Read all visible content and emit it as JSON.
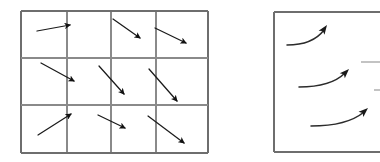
{
  "figure": {
    "background_color": "#ffffff",
    "stroke_color": "#1a1a1a",
    "grid_color": "#8a8a8a",
    "border_color": "#6e6e6e"
  },
  "left_panel": {
    "name": "discrete-vector-field-grid",
    "x": 21,
    "y": 11,
    "width": 187,
    "height": 142,
    "columns": 4,
    "rows": 3,
    "column_edges": [
      21,
      67,
      111,
      156,
      208
    ],
    "row_edges": [
      11,
      58,
      105,
      153
    ],
    "arrows": [
      {
        "id": "r1c1",
        "row": 1,
        "col": 1,
        "x1": 37,
        "y1": 31,
        "x2": 70,
        "y2": 25,
        "angle_deg": -10,
        "label": "arrow-r1c1"
      },
      {
        "id": "r1c3",
        "row": 1,
        "col": 3,
        "x1": 113,
        "y1": 19,
        "x2": 140,
        "y2": 38,
        "angle_deg": 35,
        "label": "arrow-r1c3"
      },
      {
        "id": "r1c4",
        "row": 1,
        "col": 4,
        "x1": 155,
        "y1": 28,
        "x2": 186,
        "y2": 43,
        "angle_deg": 26,
        "label": "arrow-r1c4"
      },
      {
        "id": "r2c1",
        "row": 2,
        "col": 1,
        "x1": 41,
        "y1": 63,
        "x2": 74,
        "y2": 81,
        "angle_deg": 29,
        "label": "arrow-r2c1"
      },
      {
        "id": "r2c2",
        "row": 2,
        "col": 2,
        "x1": 99,
        "y1": 66,
        "x2": 124,
        "y2": 94,
        "angle_deg": 48,
        "label": "arrow-r2c2"
      },
      {
        "id": "r2c3",
        "row": 2,
        "col": 3,
        "x1": 149,
        "y1": 69,
        "x2": 177,
        "y2": 101,
        "angle_deg": 49,
        "label": "arrow-r2c3"
      },
      {
        "id": "r3c1",
        "row": 3,
        "col": 1,
        "x1": 38,
        "y1": 135,
        "x2": 71,
        "y2": 114,
        "angle_deg": -32,
        "label": "arrow-r3c1"
      },
      {
        "id": "r3c2",
        "row": 3,
        "col": 2,
        "x1": 98,
        "y1": 115,
        "x2": 125,
        "y2": 128,
        "angle_deg": 26,
        "label": "arrow-r3c2"
      },
      {
        "id": "r3c3",
        "row": 3,
        "col": 3,
        "x1": 148,
        "y1": 116,
        "x2": 184,
        "y2": 143,
        "angle_deg": 37,
        "label": "arrow-r3c3"
      }
    ]
  },
  "right_panel": {
    "name": "continuous-streamline-panel",
    "x": 274,
    "y": 12,
    "width": 106,
    "height": 140,
    "clipped_right_edge": true,
    "streamlines": [
      {
        "id": "s1",
        "label": "streamline-top",
        "path": "M 287,45 C 302,45 315,42 324,30",
        "tip_x": 327,
        "tip_y": 25,
        "tip_angle_deg": -55
      },
      {
        "id": "s2",
        "label": "streamline-middle",
        "path": "M 299,87 C 318,87 334,84 345,73",
        "tip_x": 349,
        "tip_y": 69,
        "tip_angle_deg": -45
      },
      {
        "id": "s3",
        "label": "streamline-bottom",
        "path": "M 311,126 C 333,126 352,122 364,112",
        "tip_x": 368,
        "tip_y": 108,
        "tip_angle_deg": -42
      }
    ],
    "edge_fragments": [
      {
        "id": "f1",
        "label": "edge-fragment-upper",
        "x1": 361,
        "y1": 62,
        "x2": 380,
        "y2": 62
      },
      {
        "id": "f2",
        "label": "edge-fragment-lower",
        "x1": 374,
        "y1": 90,
        "x2": 380,
        "y2": 90
      }
    ]
  }
}
